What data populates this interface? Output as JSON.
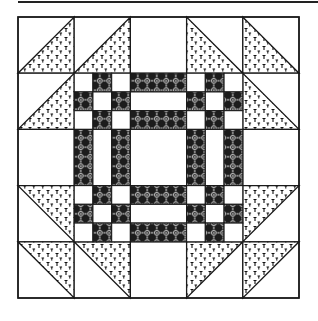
{
  "diagram": {
    "title": "",
    "type": "quilt-block",
    "colors": {
      "background": "#ffffff",
      "line": "#1a1a1a",
      "print_fill": "#ffffff",
      "print_mark": "#111111",
      "dark_fabric": "#1c1c1c",
      "dark_motif": "#ffffff",
      "light_fabric": "#ffffff"
    },
    "block": {
      "x": 18,
      "y": 17,
      "size": 281,
      "grid": 5,
      "outer_cells": [
        {
          "row": 0,
          "col": 0,
          "type": "half-square",
          "fill": "bottom-right"
        },
        {
          "row": 0,
          "col": 1,
          "type": "half-square",
          "fill": "bottom-right"
        },
        {
          "row": 0,
          "col": 2,
          "type": "plain"
        },
        {
          "row": 0,
          "col": 3,
          "type": "half-square",
          "fill": "bottom-left"
        },
        {
          "row": 0,
          "col": 4,
          "type": "half-square",
          "fill": "bottom-left"
        },
        {
          "row": 1,
          "col": 0,
          "type": "half-square",
          "fill": "bottom-right"
        },
        {
          "row": 1,
          "col": 4,
          "type": "half-square",
          "fill": "bottom-left"
        },
        {
          "row": 2,
          "col": 0,
          "type": "plain"
        },
        {
          "row": 2,
          "col": 4,
          "type": "plain"
        },
        {
          "row": 3,
          "col": 0,
          "type": "half-square",
          "fill": "top-right"
        },
        {
          "row": 3,
          "col": 4,
          "type": "half-square",
          "fill": "top-left"
        },
        {
          "row": 4,
          "col": 0,
          "type": "half-square",
          "fill": "top-right"
        },
        {
          "row": 4,
          "col": 1,
          "type": "half-square",
          "fill": "top-right"
        },
        {
          "row": 4,
          "col": 2,
          "type": "plain"
        },
        {
          "row": 4,
          "col": 3,
          "type": "half-square",
          "fill": "top-left"
        },
        {
          "row": 4,
          "col": 4,
          "type": "half-square",
          "fill": "top-left"
        }
      ],
      "center": {
        "description": "3x3 frame of nine-patch corners joined by three-strip bars around a plain center",
        "nine_patch_pattern": [
          [
            0,
            1,
            0
          ],
          [
            1,
            0,
            1
          ],
          [
            0,
            1,
            0
          ]
        ],
        "strip_pattern": [
          1,
          0,
          1
        ]
      }
    }
  }
}
